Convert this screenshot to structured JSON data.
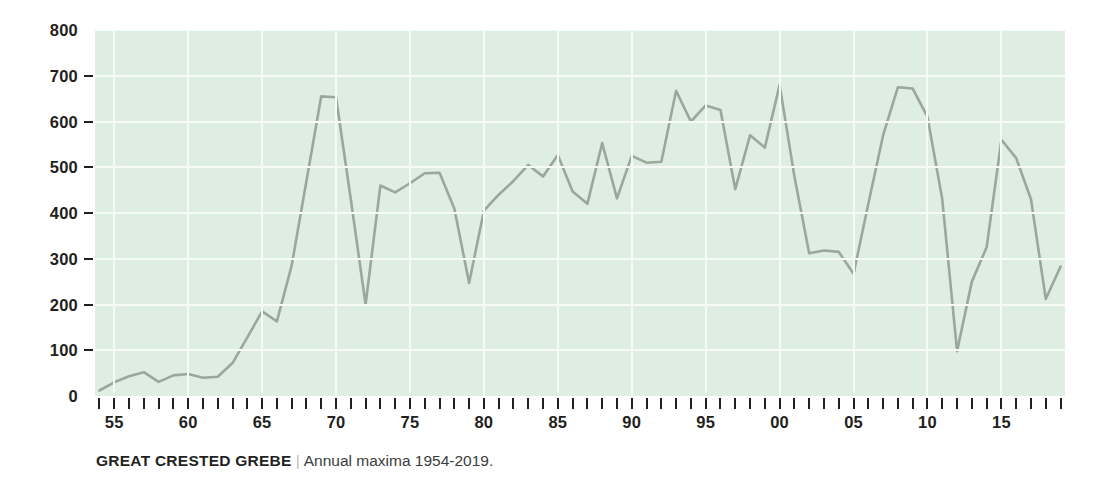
{
  "caption": {
    "title": "GREAT CRESTED GREBE",
    "separator": "|",
    "subtitle": "Annual maxima 1954-2019."
  },
  "colors": {
    "plot_background": "#dfeee2",
    "gridline": "#f6fbf7",
    "series_line": "#9aa89c",
    "text": "#231f20",
    "caption_separator": "#b9bdb9"
  },
  "chart_data": {
    "type": "line",
    "title": "GREAT CRESTED GREBE",
    "subtitle": "Annual maxima 1954-2019.",
    "xlabel": "",
    "ylabel": "",
    "ylim": [
      0,
      800
    ],
    "xlim": [
      1954,
      2019
    ],
    "grid": true,
    "legend_position": "none",
    "y_ticks": [
      0,
      100,
      200,
      300,
      400,
      500,
      600,
      700,
      800
    ],
    "y_tick_labels": [
      "0",
      "100",
      "200",
      "300",
      "400",
      "500",
      "600",
      "700",
      "800"
    ],
    "x_ticks": [
      1954,
      1955,
      1956,
      1957,
      1958,
      1959,
      1960,
      1961,
      1962,
      1963,
      1964,
      1965,
      1966,
      1967,
      1968,
      1969,
      1970,
      1971,
      1972,
      1973,
      1974,
      1975,
      1976,
      1977,
      1978,
      1979,
      1980,
      1981,
      1982,
      1983,
      1984,
      1985,
      1986,
      1987,
      1988,
      1989,
      1990,
      1991,
      1992,
      1993,
      1994,
      1995,
      1996,
      1997,
      1998,
      1999,
      2000,
      2001,
      2002,
      2003,
      2004,
      2005,
      2006,
      2007,
      2008,
      2009,
      2010,
      2011,
      2012,
      2013,
      2014,
      2015,
      2016,
      2017,
      2018,
      2019
    ],
    "x_tick_labels": [
      {
        "year": 1955,
        "label": "55"
      },
      {
        "year": 1960,
        "label": "60"
      },
      {
        "year": 1965,
        "label": "65"
      },
      {
        "year": 1970,
        "label": "70"
      },
      {
        "year": 1975,
        "label": "75"
      },
      {
        "year": 1980,
        "label": "80"
      },
      {
        "year": 1985,
        "label": "85"
      },
      {
        "year": 1990,
        "label": "90"
      },
      {
        "year": 1995,
        "label": "95"
      },
      {
        "year": 2000,
        "label": "00"
      },
      {
        "year": 2005,
        "label": "05"
      },
      {
        "year": 2010,
        "label": "10"
      },
      {
        "year": 2015,
        "label": "15"
      }
    ],
    "x": [
      1954,
      1955,
      1956,
      1957,
      1958,
      1959,
      1960,
      1961,
      1962,
      1963,
      1964,
      1965,
      1966,
      1967,
      1968,
      1969,
      1970,
      1971,
      1972,
      1973,
      1974,
      1975,
      1976,
      1977,
      1978,
      1979,
      1980,
      1981,
      1982,
      1983,
      1984,
      1985,
      1986,
      1987,
      1988,
      1989,
      1990,
      1991,
      1992,
      1993,
      1994,
      1995,
      1996,
      1997,
      1998,
      1999,
      2000,
      2001,
      2002,
      2003,
      2004,
      2005,
      2006,
      2007,
      2008,
      2009,
      2010,
      2011,
      2012,
      2013,
      2014,
      2015,
      2016,
      2017,
      2018,
      2019
    ],
    "values": [
      12,
      30,
      43,
      52,
      31,
      45,
      48,
      40,
      42,
      72,
      128,
      185,
      163,
      285,
      470,
      655,
      653,
      430,
      200,
      460,
      445,
      465,
      487,
      488,
      410,
      247,
      405,
      440,
      470,
      505,
      480,
      527,
      447,
      420,
      553,
      432,
      525,
      510,
      512,
      667,
      600,
      635,
      625,
      452,
      570,
      543,
      680,
      480,
      312,
      318,
      315,
      267,
      420,
      570,
      675,
      672,
      610,
      430,
      98,
      250,
      325,
      560,
      520,
      430,
      212,
      283
    ],
    "series": [
      {
        "name": "Great Crested Grebe annual maxima",
        "color": "#9aa89c",
        "values": [
          12,
          30,
          43,
          52,
          31,
          45,
          48,
          40,
          42,
          72,
          128,
          185,
          163,
          285,
          470,
          655,
          653,
          430,
          200,
          460,
          445,
          465,
          487,
          488,
          410,
          247,
          405,
          440,
          470,
          505,
          480,
          527,
          447,
          420,
          553,
          432,
          525,
          510,
          512,
          667,
          600,
          635,
          625,
          452,
          570,
          543,
          680,
          480,
          312,
          318,
          315,
          267,
          420,
          570,
          675,
          672,
          610,
          430,
          98,
          250,
          325,
          560,
          520,
          430,
          212,
          283
        ]
      }
    ]
  }
}
